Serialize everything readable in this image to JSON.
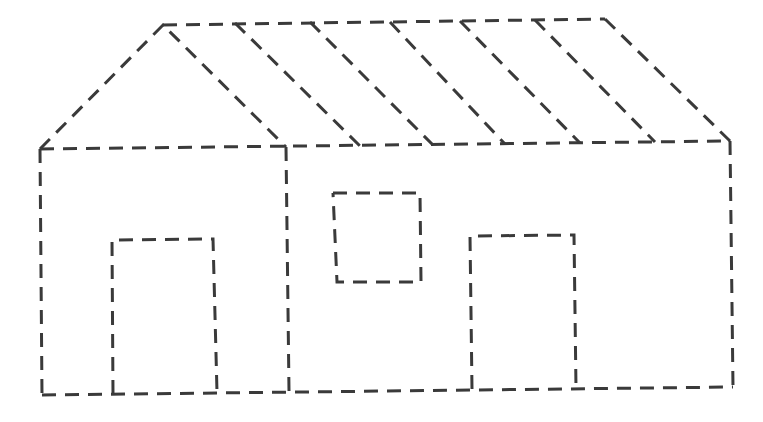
{
  "drawing": {
    "subject": "house",
    "stroke_color": "#3a3a3a",
    "background": "#ffffff",
    "style": "dashed-outline",
    "roof": {
      "gable": [
        [
          40,
          149
        ],
        [
          163,
          25
        ],
        [
          286,
          147
        ]
      ],
      "top_edge": [
        [
          163,
          25
        ],
        [
          605,
          19
        ]
      ],
      "right_slope": [
        [
          605,
          19
        ],
        [
          730,
          141
        ]
      ],
      "eave": [
        [
          40,
          149
        ],
        [
          730,
          141
        ]
      ],
      "slats": [
        [
          [
            235,
            23
          ],
          [
            360,
            146
          ]
        ],
        [
          [
            310,
            22
          ],
          [
            433,
            145
          ]
        ],
        [
          [
            390,
            22
          ],
          [
            505,
            144
          ]
        ],
        [
          [
            460,
            21
          ],
          [
            580,
            143
          ]
        ],
        [
          [
            535,
            20
          ],
          [
            655,
            142
          ]
        ]
      ]
    },
    "walls": {
      "left": [
        [
          40,
          149
        ],
        [
          42,
          395
        ]
      ],
      "partition": [
        [
          286,
          147
        ],
        [
          289,
          391
        ]
      ],
      "right": [
        [
          730,
          141
        ],
        [
          733,
          387
        ]
      ],
      "floor": [
        [
          42,
          395
        ],
        [
          733,
          387
        ]
      ]
    },
    "left_door": {
      "points": [
        [
          113,
          394
        ],
        [
          112,
          240
        ],
        [
          213,
          239
        ],
        [
          217,
          392
        ]
      ]
    },
    "window": {
      "points": [
        [
          333,
          193
        ],
        [
          420,
          193
        ],
        [
          421,
          282
        ],
        [
          337,
          282
        ],
        [
          333,
          193
        ]
      ]
    },
    "right_door": {
      "points": [
        [
          472,
          389
        ],
        [
          470,
          236
        ],
        [
          574,
          235
        ],
        [
          576,
          388
        ]
      ]
    }
  }
}
